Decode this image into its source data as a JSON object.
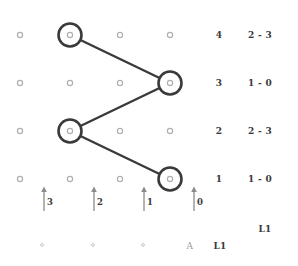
{
  "diagram": {
    "type": "trellis-lattice",
    "grid": {
      "columns": 4,
      "rows": 4,
      "node_x": [
        20,
        70,
        120,
        170
      ],
      "node_y": [
        35,
        83,
        131,
        179
      ],
      "small_node_color": "#b0b0b0",
      "highlight_node_color": "#3a3a3a",
      "path_color": "#3a3a3a"
    },
    "nodes": [
      {
        "col": 0,
        "row": 0,
        "highlighted": false
      },
      {
        "col": 1,
        "row": 0,
        "highlighted": true
      },
      {
        "col": 2,
        "row": 0,
        "highlighted": false
      },
      {
        "col": 3,
        "row": 0,
        "highlighted": false
      },
      {
        "col": 0,
        "row": 1,
        "highlighted": false
      },
      {
        "col": 1,
        "row": 1,
        "highlighted": false
      },
      {
        "col": 2,
        "row": 1,
        "highlighted": false
      },
      {
        "col": 3,
        "row": 1,
        "highlighted": true
      },
      {
        "col": 0,
        "row": 2,
        "highlighted": false
      },
      {
        "col": 1,
        "row": 2,
        "highlighted": true
      },
      {
        "col": 2,
        "row": 2,
        "highlighted": false
      },
      {
        "col": 3,
        "row": 2,
        "highlighted": false
      },
      {
        "col": 0,
        "row": 3,
        "highlighted": false
      },
      {
        "col": 1,
        "row": 3,
        "highlighted": false
      },
      {
        "col": 2,
        "row": 3,
        "highlighted": false
      },
      {
        "col": 3,
        "row": 3,
        "highlighted": true
      }
    ],
    "path_segments": [
      {
        "from": {
          "col": 1,
          "row": 0
        },
        "to": {
          "col": 3,
          "row": 1
        }
      },
      {
        "from": {
          "col": 3,
          "row": 1
        },
        "to": {
          "col": 1,
          "row": 2
        }
      },
      {
        "from": {
          "col": 1,
          "row": 2
        },
        "to": {
          "col": 3,
          "row": 3
        }
      }
    ],
    "state_rows": [
      {
        "index": "4",
        "pair": "2 - 3"
      },
      {
        "index": "3",
        "pair": "1 - 0"
      },
      {
        "index": "2",
        "pair": "2 - 3"
      },
      {
        "index": "1",
        "pair": "1 - 0"
      }
    ],
    "ticks": [
      {
        "label": "3",
        "x": 44
      },
      {
        "label": "2",
        "x": 94
      },
      {
        "label": "1",
        "x": 144
      },
      {
        "label": "0",
        "x": 194
      }
    ],
    "tick_arrow_color": "#8a8a8a",
    "bottom_dots": [
      {
        "x": 42
      },
      {
        "x": 93
      },
      {
        "x": 143
      }
    ],
    "bottom_dot_color": "#c8c8c8",
    "captions": {
      "upper_right": "L1",
      "bottom_letter": "A",
      "bottom_label": "L1"
    }
  }
}
